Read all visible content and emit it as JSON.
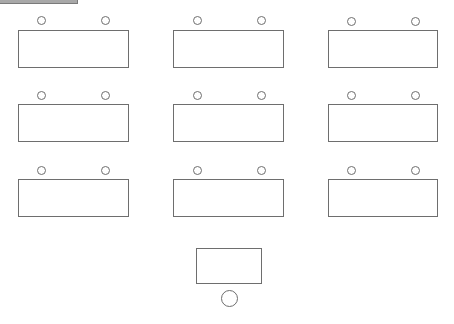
{
  "diagram": {
    "type": "classroom-seating-layout",
    "colors": {
      "stroke": "#6e6e6e",
      "background": "#ffffff",
      "top_bar": "#a8a8a8"
    },
    "student_desks": [
      {
        "row": 1,
        "col": 1,
        "x": 18,
        "y": 30,
        "w": 111,
        "h": 38,
        "seats": [
          {
            "cx": 41,
            "cy": 20
          },
          {
            "cx": 105,
            "cy": 20
          }
        ]
      },
      {
        "row": 1,
        "col": 2,
        "x": 173,
        "y": 30,
        "w": 111,
        "h": 38,
        "seats": [
          {
            "cx": 197,
            "cy": 20
          },
          {
            "cx": 261,
            "cy": 20
          }
        ]
      },
      {
        "row": 1,
        "col": 3,
        "x": 328,
        "y": 30,
        "w": 110,
        "h": 38,
        "seats": [
          {
            "cx": 351,
            "cy": 21
          },
          {
            "cx": 415,
            "cy": 21
          }
        ]
      },
      {
        "row": 2,
        "col": 1,
        "x": 18,
        "y": 104,
        "w": 111,
        "h": 38,
        "seats": [
          {
            "cx": 41,
            "cy": 95
          },
          {
            "cx": 105,
            "cy": 95
          }
        ]
      },
      {
        "row": 2,
        "col": 2,
        "x": 173,
        "y": 104,
        "w": 111,
        "h": 38,
        "seats": [
          {
            "cx": 197,
            "cy": 95
          },
          {
            "cx": 261,
            "cy": 95
          }
        ]
      },
      {
        "row": 2,
        "col": 3,
        "x": 328,
        "y": 104,
        "w": 110,
        "h": 38,
        "seats": [
          {
            "cx": 351,
            "cy": 95
          },
          {
            "cx": 415,
            "cy": 95
          }
        ]
      },
      {
        "row": 3,
        "col": 1,
        "x": 18,
        "y": 179,
        "w": 111,
        "h": 38,
        "seats": [
          {
            "cx": 41,
            "cy": 170
          },
          {
            "cx": 105,
            "cy": 170
          }
        ]
      },
      {
        "row": 3,
        "col": 2,
        "x": 173,
        "y": 179,
        "w": 111,
        "h": 38,
        "seats": [
          {
            "cx": 197,
            "cy": 170
          },
          {
            "cx": 261,
            "cy": 170
          }
        ]
      },
      {
        "row": 3,
        "col": 3,
        "x": 328,
        "y": 179,
        "w": 110,
        "h": 38,
        "seats": [
          {
            "cx": 351,
            "cy": 170
          },
          {
            "cx": 415,
            "cy": 170
          }
        ]
      }
    ],
    "student_seat_radius": 4,
    "teacher_desk": {
      "x": 196,
      "y": 248,
      "w": 66,
      "h": 36
    },
    "teacher_seat": {
      "cx": 229,
      "cy": 298,
      "r": 8
    }
  }
}
